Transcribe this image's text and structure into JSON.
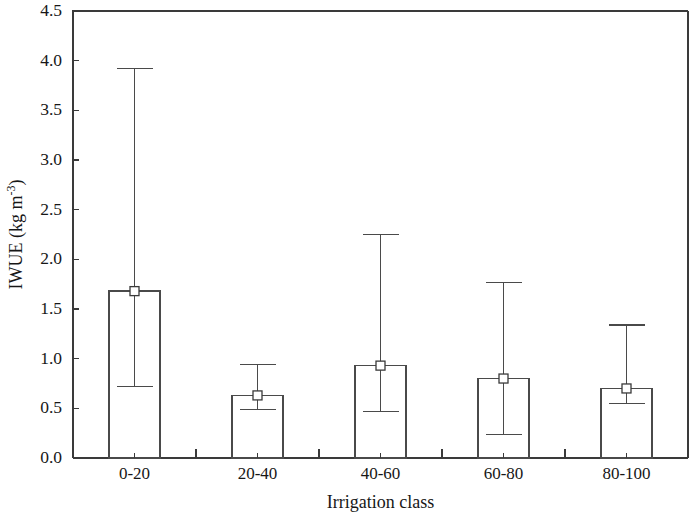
{
  "chart_data": {
    "type": "bar",
    "title": "",
    "subtitle": "",
    "xlabel": "Irrigation class",
    "ylabel": "IWUE (kg m-3)",
    "ylabel_parts": {
      "base": "IWUE (kg m",
      "superscript": "-3",
      "tail": ")"
    },
    "categories": [
      "0-20",
      "20-40",
      "40-60",
      "60-80",
      "80-100"
    ],
    "values": [
      1.68,
      0.63,
      0.93,
      0.8,
      0.7
    ],
    "error_upper": [
      3.92,
      0.94,
      2.25,
      1.77,
      1.34
    ],
    "error_lower": [
      0.72,
      0.49,
      0.47,
      0.24,
      0.55
    ],
    "ylim": [
      0.0,
      4.5
    ],
    "ytick_values": [
      0.0,
      0.5,
      1.0,
      1.5,
      2.0,
      2.5,
      3.0,
      3.5,
      4.0,
      4.5
    ],
    "ytick_labels": [
      "0.0",
      "0.5",
      "1.0",
      "1.5",
      "2.0",
      "2.5",
      "3.0",
      "3.5",
      "4.0",
      "4.5"
    ],
    "grid": false,
    "legend": null,
    "legend_position": "none",
    "marker": "open-square",
    "bar_fill": "none",
    "colors": {
      "axis": "#3a3a3a",
      "bar_stroke": "#4a4a4a",
      "marker_fill": "#ffffff",
      "background": "#ffffff",
      "text": "#171717"
    }
  }
}
